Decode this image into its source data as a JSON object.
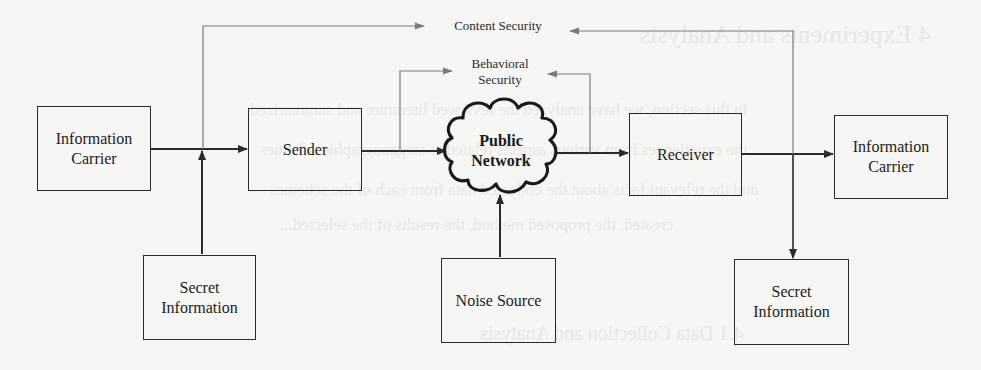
{
  "diagram": {
    "type": "block-diagram",
    "nodes": {
      "info_carrier_left": {
        "line1": "Information",
        "line2": "Carrier"
      },
      "sender": {
        "label": "Sender"
      },
      "public_network": {
        "line1": "Public",
        "line2": "Network"
      },
      "receiver": {
        "label": "Receiver"
      },
      "info_carrier_right": {
        "line1": "Information",
        "line2": "Carrier"
      },
      "secret_info_left": {
        "line1": "Secret",
        "line2": "Information"
      },
      "noise_source": {
        "label": "Noise Source"
      },
      "secret_info_right": {
        "line1": "Secret",
        "line2": "Information"
      }
    },
    "annotations": {
      "content_security": "Content Security",
      "behavioral_security_line1": "Behavioral",
      "behavioral_security_line2": "Security"
    },
    "edges": [
      {
        "from": "Information Carrier",
        "to": "Sender"
      },
      {
        "from": "Secret Information",
        "to": "Sender input junction"
      },
      {
        "from": "Sender",
        "to": "Public Network"
      },
      {
        "from": "Noise Source",
        "to": "Public Network"
      },
      {
        "from": "Public Network",
        "to": "Receiver"
      },
      {
        "from": "Receiver",
        "to": "Information Carrier"
      },
      {
        "from": "Receiver output junction",
        "to": "Secret Information"
      },
      {
        "from": "Sender input junction",
        "to": "Content Security"
      },
      {
        "from": "Receiver output junction",
        "to": "Content Security"
      },
      {
        "from": "Sender output",
        "to": "Behavioral Security"
      },
      {
        "from": "Public Network output",
        "to": "Behavioral Security"
      }
    ],
    "colors": {
      "stroke_main": "#2b2b2b",
      "stroke_security": "#7a7a7a",
      "background": "#f6f6f4"
    }
  },
  "background_bleed": {
    "heading": "4   Experiments and Analysis",
    "line1": "In this section, we have analyzed the reviewed literature and summarized",
    "line2": "the experiences from various aspects related to steganographic schemes",
    "line3": "and the relevant facts about the collected data from each of the schemes",
    "line4": "created, the proposed method, the results of the selected...",
    "subheading": "4.1   Data Collection and Analysis"
  }
}
